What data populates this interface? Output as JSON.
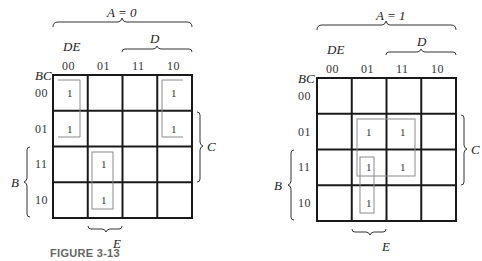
{
  "figure_caption": "FIGURE 3-13",
  "colors": {
    "grid": "#1a1a1a",
    "group_box": "#8a8a8a",
    "brace": "#333333",
    "caption": "#666666"
  },
  "maps": [
    {
      "id": "a0",
      "title": "A = 0",
      "col_var": "DE",
      "row_var": "BC",
      "col_codes": [
        "00",
        "01",
        "11",
        "10"
      ],
      "row_codes": [
        "00",
        "01",
        "11",
        "10"
      ],
      "brace_top": "D",
      "brace_right": "C",
      "brace_left": "B",
      "brace_bottom": "E",
      "cells": [
        [
          "1",
          "",
          "",
          "1"
        ],
        [
          "1",
          "",
          "",
          "1"
        ],
        [
          "",
          "1",
          "",
          ""
        ],
        [
          "",
          "1",
          "",
          ""
        ]
      ],
      "groups": [
        {
          "name": "group-col00-rows00-01",
          "cells": "m0=1,m2=1"
        },
        {
          "name": "group-col10-rows00-01",
          "cells": "m4=1,m6=1"
        },
        {
          "name": "group-col01-rows11-10",
          "cells": "m13=1,m9=1"
        }
      ]
    },
    {
      "id": "a1",
      "title": "A = 1",
      "col_var": "DE",
      "row_var": "BC",
      "col_codes": [
        "00",
        "01",
        "11",
        "10"
      ],
      "row_codes": [
        "00",
        "01",
        "11",
        "10"
      ],
      "brace_top": "D",
      "brace_right": "C",
      "brace_left": "B",
      "brace_bottom": "E",
      "cells": [
        [
          "",
          "",
          "",
          ""
        ],
        [
          "",
          "1",
          "1",
          ""
        ],
        [
          "",
          "1",
          "1",
          ""
        ],
        [
          "",
          "1",
          "",
          ""
        ]
      ],
      "groups": [
        {
          "name": "group-quad-rows01-11-cols01-11",
          "cells": "4 cells"
        },
        {
          "name": "group-col01-rows11-10",
          "cells": "2 cells"
        }
      ]
    }
  ]
}
